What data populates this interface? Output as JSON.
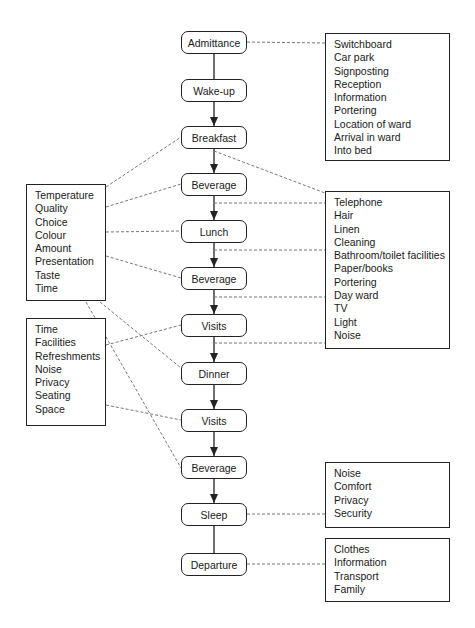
{
  "stages": [
    {
      "id": "admittance",
      "label": "Admittance"
    },
    {
      "id": "wake-up",
      "label": "Wake-up"
    },
    {
      "id": "breakfast",
      "label": "Breakfast"
    },
    {
      "id": "beverage-1",
      "label": "Beverage"
    },
    {
      "id": "lunch",
      "label": "Lunch"
    },
    {
      "id": "beverage-2",
      "label": "Beverage"
    },
    {
      "id": "visits-1",
      "label": "Visits"
    },
    {
      "id": "dinner",
      "label": "Dinner"
    },
    {
      "id": "visits-2",
      "label": "Visits"
    },
    {
      "id": "beverage-3",
      "label": "Beverage"
    },
    {
      "id": "sleep",
      "label": "Sleep"
    },
    {
      "id": "departure",
      "label": "Departure"
    }
  ],
  "attribute_boxes": {
    "admittance": {
      "items": [
        "Switchboard",
        "Car park",
        "Signposting",
        "Reception",
        "Information",
        "Portering",
        "Location of ward",
        "Arrival in ward",
        "Into bed"
      ]
    },
    "ward": {
      "items": [
        "Telephone",
        "Hair",
        "Linen",
        "Cleaning",
        "Bathroom/toilet facilities",
        "Paper/books",
        "Portering",
        "Day ward",
        "TV",
        "Light",
        "Noise"
      ]
    },
    "food": {
      "items": [
        "Temperature",
        "Quality",
        "Choice",
        "Colour",
        "Amount",
        "Presentation",
        "Taste",
        "Time"
      ]
    },
    "visits": {
      "items": [
        "Time",
        "Facilities",
        "Refreshments",
        "Noise",
        "Privacy",
        "Seating",
        "Space"
      ]
    },
    "sleep": {
      "items": [
        "Noise",
        "Comfort",
        "Privacy",
        "Security"
      ]
    },
    "departure": {
      "items": [
        "Clothes",
        "Information",
        "Transport",
        "Family"
      ]
    }
  },
  "connections": [
    {
      "from": "admittance",
      "to": "admittance-box"
    },
    {
      "from": "breakfast",
      "to": "ward-box"
    },
    {
      "from": "beverage-1",
      "to": "ward-box"
    },
    {
      "from": "lunch",
      "to": "ward-box"
    },
    {
      "from": "beverage-2",
      "to": "ward-box"
    },
    {
      "from": "visits-1",
      "to": "ward-box"
    },
    {
      "from": "food-box",
      "to": "breakfast"
    },
    {
      "from": "food-box",
      "to": "beverage-1"
    },
    {
      "from": "food-box",
      "to": "lunch"
    },
    {
      "from": "food-box",
      "to": "beverage-2"
    },
    {
      "from": "food-box",
      "to": "dinner"
    },
    {
      "from": "food-box",
      "to": "beverage-3"
    },
    {
      "from": "visits-box",
      "to": "visits-1"
    },
    {
      "from": "visits-box",
      "to": "visits-2"
    },
    {
      "from": "sleep",
      "to": "sleep-box"
    },
    {
      "from": "departure",
      "to": "departure-box"
    }
  ],
  "colors": {
    "line": "#222222",
    "dashed": "#777777",
    "background": "#ffffff"
  }
}
